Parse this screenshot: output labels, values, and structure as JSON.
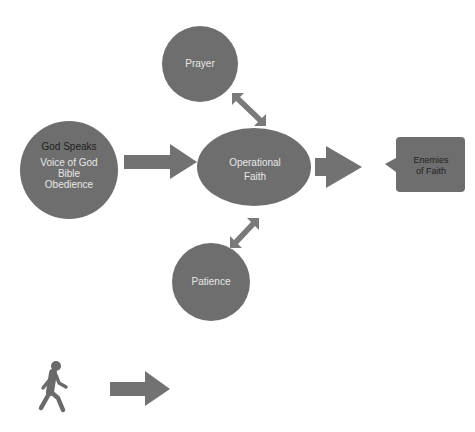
{
  "diagram": {
    "colors": {
      "shape_fill": "#6e6e6e",
      "arrow_fill": "#727272",
      "background": "#ffffff",
      "text_light": "#e8e8e8",
      "text_dark": "#1e1e1e"
    },
    "nodes": {
      "god_speaks": {
        "title": "God Speaks",
        "lines": [
          "Voice of God",
          "Bible",
          "Obedience"
        ]
      },
      "operational_faith": {
        "lines": [
          "Operational",
          "Faith"
        ]
      },
      "prayer": {
        "label": "Prayer"
      },
      "patience": {
        "label": "Patience"
      },
      "enemies": {
        "lines": [
          "Enemies",
          "of Faith"
        ]
      }
    },
    "edges": [
      {
        "from": "god_speaks",
        "to": "operational_faith",
        "type": "arrow"
      },
      {
        "from": "prayer",
        "to": "operational_faith",
        "type": "double-arrow"
      },
      {
        "from": "patience",
        "to": "operational_faith",
        "type": "double-arrow"
      },
      {
        "from": "operational_faith",
        "to": "enemies",
        "type": "arrow"
      }
    ],
    "legend": {
      "icon": "walking-person-icon",
      "arrow": "right-arrow-icon"
    }
  }
}
